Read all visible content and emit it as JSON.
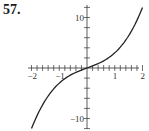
{
  "problem": {
    "number": "57."
  },
  "chart_data": {
    "type": "line",
    "title": "",
    "xlabel": "",
    "ylabel": "",
    "xlim": [
      -2,
      2
    ],
    "ylim": [
      -12.5,
      12.5
    ],
    "x_tick_labels": [
      "-2",
      "-1",
      "1",
      "2"
    ],
    "y_tick_labels": [
      "10",
      "-10"
    ],
    "x_minor_tick_step": 0.2,
    "y_minor_tick_step": 2,
    "grid": false,
    "legend": null,
    "series": [
      {
        "name": "f(x)",
        "x": [
          -2,
          -1.5,
          -1,
          -0.5,
          0,
          0.5,
          1,
          1.5,
          2
        ],
        "y": [
          -12,
          -6.4,
          -3,
          -1.1,
          0,
          1.1,
          3,
          6.4,
          12
        ]
      }
    ],
    "colors": {
      "curve": "#222222",
      "axes": "#333333"
    }
  }
}
